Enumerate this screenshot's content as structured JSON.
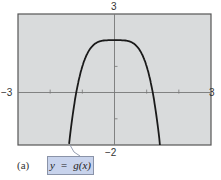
{
  "panel": {
    "label": "(a)"
  },
  "legend": {
    "equation": "y  =  g(x)"
  },
  "axes": {
    "x_min_label": "−3",
    "x_max_label": "3",
    "y_max_label": "3",
    "y_min_label": "−2"
  },
  "colors": {
    "plot_background": "#d9dbdc",
    "frame": "#555555",
    "axis": "#777777",
    "curve": "#1a1a1a",
    "label_box": "#c8d3ec"
  },
  "chart_data": {
    "type": "line",
    "title": "",
    "xlabel": "",
    "ylabel": "",
    "xlim": [
      -3,
      3
    ],
    "ylim": [
      -2,
      3
    ],
    "x_ticks": [
      -3,
      -2,
      -1,
      0,
      1,
      2,
      3
    ],
    "y_ticks": [
      -2,
      -1,
      0,
      1,
      2,
      3
    ],
    "grid": false,
    "legend": {
      "entries": [
        "y = g(x)"
      ],
      "position": "bottom-left callout"
    },
    "series": [
      {
        "name": "y = g(x)",
        "x": [
          -1.41,
          -1.3,
          -1.19,
          -1.1,
          -1.0,
          -0.9,
          -0.8,
          -0.6,
          -0.4,
          -0.2,
          0,
          0.2,
          0.4,
          0.6,
          0.8,
          0.9,
          1.0,
          1.1,
          1.19,
          1.3,
          1.41
        ],
        "values": [
          -2.0,
          -0.86,
          0.0,
          0.54,
          1.0,
          1.34,
          1.59,
          1.87,
          1.97,
          2.0,
          2.0,
          2.0,
          1.97,
          1.87,
          1.59,
          1.34,
          1.0,
          0.54,
          0.0,
          -0.86,
          -2.0
        ]
      }
    ],
    "annotations": [
      "(a)"
    ]
  }
}
